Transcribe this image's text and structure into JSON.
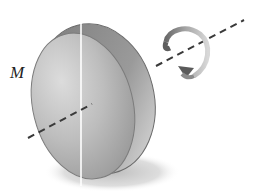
{
  "diagram": {
    "label": "M",
    "elements": [
      {
        "name": "disk",
        "description": "tilted circular disk shown in perspective with visible rim"
      },
      {
        "name": "axis",
        "description": "dashed axis passing through disk center, oriented lower-left to upper-right"
      },
      {
        "name": "vertical-line",
        "description": "thin white vertical reference line across disk face"
      },
      {
        "name": "rotation-arrow",
        "description": "curved arrow circling the axis indicating rotation"
      },
      {
        "name": "shadow",
        "description": "soft grey shadow below disk"
      }
    ],
    "colors": {
      "disk_face": "#b8b8b8",
      "disk_face_light": "#d6d6d6",
      "disk_rim": "#8c8c8c",
      "disk_rim_dark": "#6e6e6e",
      "axis": "#3a3a3a",
      "arrow": "#7a7a7a",
      "arrow_light": "#c8c8c8",
      "shadow": "#c4c4c4",
      "label": "#222222"
    }
  }
}
